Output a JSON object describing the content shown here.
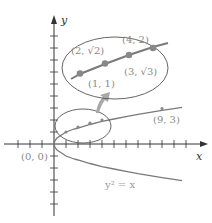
{
  "diagram": {
    "axes": {
      "x_label": "x",
      "y_label": "y",
      "origin_label": "(0, 0)"
    },
    "curve": {
      "equation_label": "y² = x",
      "color": "#7a7a7a"
    },
    "points": [
      {
        "label": "(9, 3)",
        "x": 9,
        "y": 3
      }
    ],
    "inset": {
      "points": [
        {
          "label": "(1, 1)"
        },
        {
          "label": "(2, √2)"
        },
        {
          "label": "(3, √3)"
        },
        {
          "label": "(4, 2)"
        }
      ],
      "arrow": "magnify-arrow"
    },
    "colors": {
      "axis": "#333333",
      "curve": "#7a7a7a",
      "dots": "#888888",
      "ellipse": "#555555",
      "arrow": "#a8a8a8",
      "labels": "#8a8a8a"
    }
  }
}
